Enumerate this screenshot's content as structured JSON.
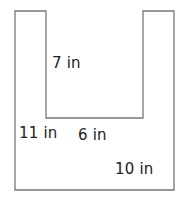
{
  "diagram": {
    "type": "u-shape-dimensions",
    "stroke_color": "#777777",
    "fill_color": "#ffffff",
    "labels": {
      "inner_depth": "7 in",
      "outer_height": "11 in",
      "inner_width": "6 in",
      "outer_width": "10 in"
    }
  }
}
